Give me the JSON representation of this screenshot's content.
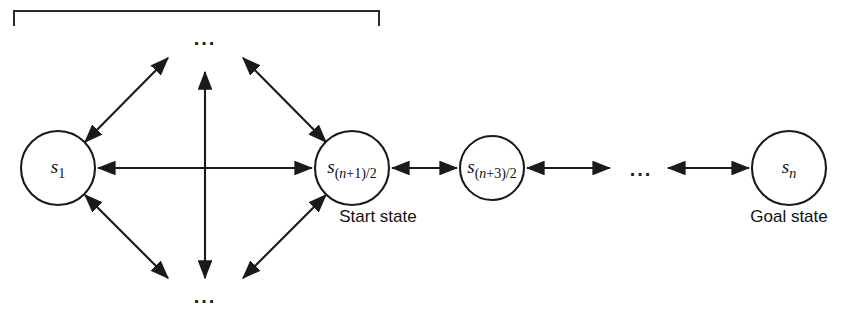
{
  "figure": {
    "title_bracket": {
      "name": "top-grouping-bracket",
      "visible": true,
      "x_left": 14,
      "x_right": 379,
      "y_top": 10,
      "y_bottom": 26
    },
    "background_color": "#ffffff",
    "stroke_color": "#1a1a1a",
    "width": 848,
    "height": 313
  },
  "nodes": [
    {
      "id": "s1",
      "label_base": "s",
      "label_sub": "1",
      "cx": 58,
      "cy": 168,
      "r": 37,
      "caption": ""
    },
    {
      "id": "s_center",
      "label_base": "s",
      "label_sub": "(n+1)/2",
      "cx": 352,
      "cy": 168,
      "r": 37,
      "caption": "Start state"
    },
    {
      "id": "s_next",
      "label_base": "s",
      "label_sub": "(n+3)/2",
      "cx": 492,
      "cy": 168,
      "r": 32,
      "caption": ""
    },
    {
      "id": "s_n",
      "label_base": "s",
      "label_sub": "n",
      "cx": 789,
      "cy": 168,
      "r": 37,
      "caption": "Goal state"
    }
  ],
  "ellipses": [
    {
      "id": "ellipsis-top",
      "text": "...",
      "x": 205,
      "y": 45
    },
    {
      "id": "ellipsis-bottom",
      "text": "...",
      "x": 205,
      "y": 300
    },
    {
      "id": "ellipsis-right",
      "text": "...",
      "x": 641,
      "y": 176
    }
  ],
  "edges": [
    {
      "id": "edge-s1-center-horizontal",
      "kind": "double-arrow"
    },
    {
      "id": "edge-s1-upper-right-diagonal",
      "kind": "double-arrow"
    },
    {
      "id": "edge-s1-lower-right-diagonal",
      "kind": "double-arrow"
    },
    {
      "id": "edge-center-upper-left-diagonal",
      "kind": "double-arrow"
    },
    {
      "id": "edge-center-lower-left-diagonal",
      "kind": "double-arrow"
    },
    {
      "id": "edge-vertical-middle",
      "kind": "double-arrow"
    },
    {
      "id": "edge-center-to-next",
      "kind": "double-arrow"
    },
    {
      "id": "edge-next-to-ellipsis",
      "kind": "double-arrow"
    },
    {
      "id": "edge-ellipsis-to-goal",
      "kind": "double-arrow"
    }
  ],
  "captions": {
    "start_state": "Start state",
    "goal_state": "Goal state"
  }
}
